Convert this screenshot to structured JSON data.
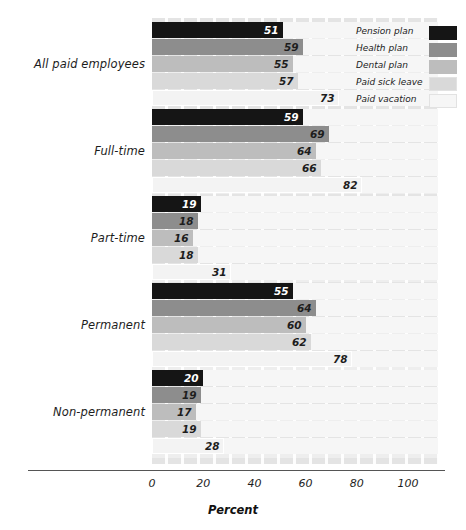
{
  "chart_data": {
    "type": "bar",
    "orientation": "horizontal",
    "title": "",
    "xlabel": "Percent",
    "ylabel": "",
    "xlim": [
      0,
      100
    ],
    "xticks": [
      0,
      20,
      40,
      60,
      80,
      100
    ],
    "grid": true,
    "legend_position": "top-right",
    "categories": [
      "All paid employees",
      "Full-time",
      "Part-time",
      "Permanent",
      "Non-permanent"
    ],
    "series": [
      {
        "name": "Pension plan",
        "color": "#151515",
        "label_color": "#ffffff",
        "values": [
          51,
          59,
          19,
          55,
          20
        ]
      },
      {
        "name": "Health plan",
        "color": "#8d8d8d",
        "label_color": "#1d1d1d",
        "values": [
          59,
          69,
          18,
          64,
          19
        ]
      },
      {
        "name": "Dental plan",
        "color": "#bdbdbd",
        "label_color": "#1d1d1d",
        "values": [
          55,
          64,
          16,
          60,
          17
        ]
      },
      {
        "name": "Paid sick leave",
        "color": "#d9d9d9",
        "label_color": "#1d1d1d",
        "values": [
          57,
          66,
          18,
          62,
          19
        ]
      },
      {
        "name": "Paid vacation",
        "color": "#f3f3f3",
        "label_color": "#1d1d1d",
        "values": [
          73,
          82,
          31,
          78,
          28
        ]
      }
    ]
  },
  "axis": {
    "tick_labels": [
      "0",
      "20",
      "40",
      "60",
      "80",
      "100"
    ],
    "x_axis_title": "Percent"
  },
  "legend": {
    "items": [
      {
        "label": "Pension plan",
        "swatch": "#151515"
      },
      {
        "label": "Health plan",
        "swatch": "#8d8d8d"
      },
      {
        "label": "Dental plan",
        "swatch": "#bdbdbd"
      },
      {
        "label": "Paid sick leave",
        "swatch": "#d9d9d9"
      },
      {
        "label": "Paid vacation",
        "swatch": "#f6f6f6"
      }
    ]
  }
}
